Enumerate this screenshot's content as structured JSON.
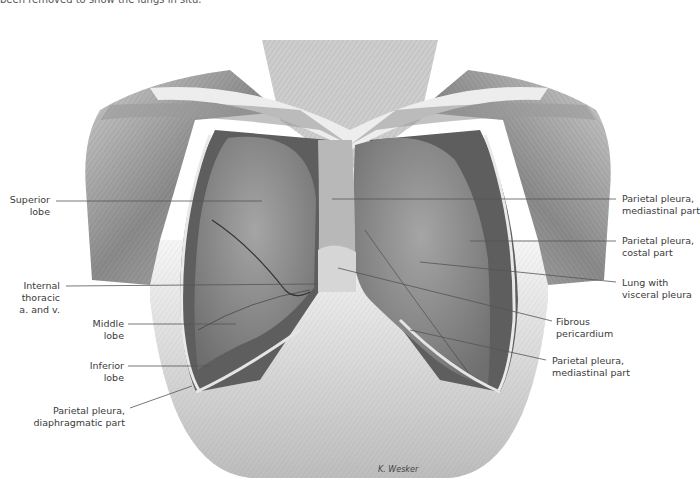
{
  "figure": {
    "caption_fragment": "been removed to show the lungs in situ.",
    "artist_signature": "K. Wesker"
  },
  "labels_left": [
    {
      "id": "superior-lobe",
      "lines": [
        "Superior",
        "lobe"
      ]
    },
    {
      "id": "internal-thoracic",
      "lines": [
        "Internal",
        "thoracic",
        "a. and v."
      ]
    },
    {
      "id": "middle-lobe",
      "lines": [
        "Middle",
        "lobe"
      ]
    },
    {
      "id": "inferior-lobe",
      "lines": [
        "Inferior",
        "lobe"
      ]
    },
    {
      "id": "parietal-pleura-diaphragmatic",
      "lines": [
        "Parietal pleura,",
        "diaphragmatic part"
      ]
    }
  ],
  "labels_right": [
    {
      "id": "parietal-pleura-mediastinal-upper",
      "lines": [
        "Parietal pleura,",
        "mediastinal part"
      ]
    },
    {
      "id": "parietal-pleura-costal",
      "lines": [
        "Parietal pleura,",
        "costal part"
      ]
    },
    {
      "id": "lung-visceral-pleura",
      "lines": [
        "Lung with",
        "visceral pleura"
      ]
    },
    {
      "id": "fibrous-pericardium",
      "lines": [
        "Fibrous",
        "pericardium"
      ]
    },
    {
      "id": "parietal-pleura-mediastinal-lower",
      "lines": [
        "Parietal pleura,",
        "mediastinal part"
      ]
    }
  ],
  "colors": {
    "background": "#ffffff",
    "label_text": "#3a3a3a",
    "leader_line": "#555555",
    "muscle_dark": "#7a7a7a",
    "muscle_light": "#d8d8d8",
    "lung": "#8f8f8f"
  }
}
